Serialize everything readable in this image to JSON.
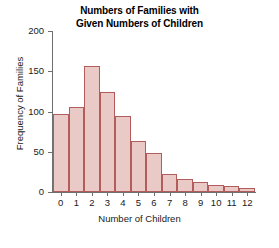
{
  "chart_data": {
    "type": "bar",
    "title": "Numbers of Families with Given Numbers of Children",
    "title_lines": [
      "Numbers of Families with",
      "Given Numbers of Children"
    ],
    "xlabel": "Number of Children",
    "ylabel": "Frequency of Families",
    "categories": [
      "0",
      "1",
      "2",
      "3",
      "4",
      "5",
      "6",
      "7",
      "8",
      "9",
      "10",
      "11",
      "12"
    ],
    "values": [
      97,
      105,
      156,
      124,
      94,
      63,
      48,
      22,
      16,
      13,
      9,
      7,
      5
    ],
    "xlim": [
      -0.5,
      12.5
    ],
    "ylim": [
      0,
      200
    ],
    "ytick_labels": [
      "0",
      "50",
      "100",
      "150",
      "200"
    ],
    "ytick_values": [
      0,
      50,
      100,
      150,
      200
    ],
    "xtick_labels": [
      "0",
      "1",
      "2",
      "3",
      "4",
      "5",
      "6",
      "7",
      "8",
      "9",
      "10",
      "11",
      "12"
    ],
    "grid": false,
    "legend": false,
    "bar_fill_color": "#e9cac7",
    "bar_edge_color": "#b35c5c",
    "axis_color": "#6f6f6f",
    "background_color": "#ffffff"
  }
}
